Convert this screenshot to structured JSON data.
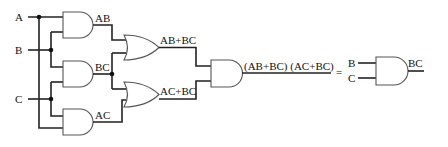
{
  "diagram": {
    "type": "logic-circuit",
    "inputs": [
      {
        "label": "A"
      },
      {
        "label": "B"
      },
      {
        "label": "C"
      }
    ],
    "gates": [
      {
        "id": "and-ab",
        "type": "AND",
        "output_label": "AB"
      },
      {
        "id": "and-bc",
        "type": "AND",
        "output_label": "BC"
      },
      {
        "id": "and-ac",
        "type": "AND",
        "output_label": "AC"
      },
      {
        "id": "or-1",
        "type": "OR",
        "output_label": "AB+BC"
      },
      {
        "id": "or-2",
        "type": "OR",
        "output_label": "AC+BC"
      },
      {
        "id": "and-final",
        "type": "AND",
        "output_label": "(AB+BC) (AC+BC)"
      }
    ],
    "equals": "=",
    "simplified": {
      "inputs": [
        "B",
        "C"
      ],
      "type": "AND",
      "output_label": "BC"
    }
  }
}
